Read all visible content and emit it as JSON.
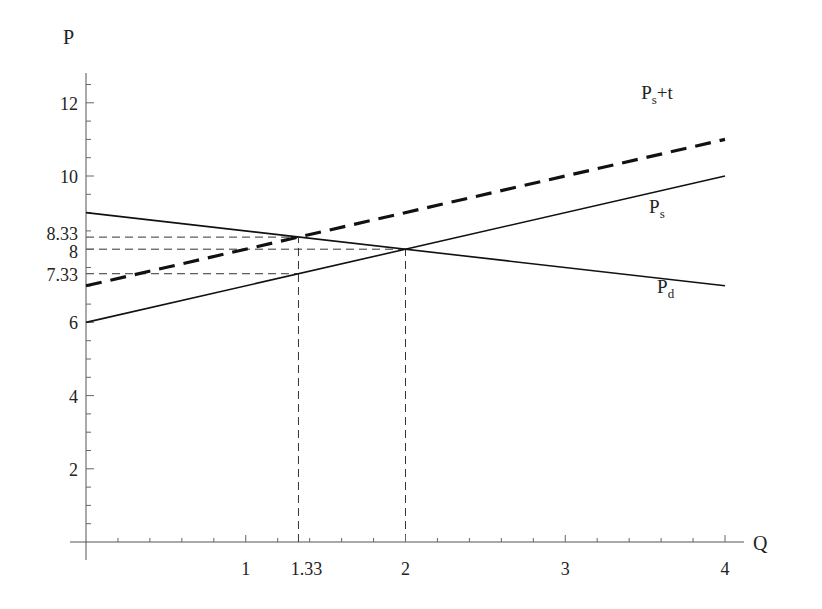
{
  "chart_data": {
    "type": "line",
    "title": "",
    "xlabel": "Q",
    "ylabel": "P",
    "xlim": [
      0,
      4
    ],
    "ylim": [
      0,
      13
    ],
    "grid": false,
    "legend_position": "inline labels at right",
    "x_ticks": [
      {
        "value": 1,
        "label": "1"
      },
      {
        "value": 1.33,
        "label": "1.33"
      },
      {
        "value": 2,
        "label": "2"
      },
      {
        "value": 3,
        "label": "3"
      },
      {
        "value": 4,
        "label": "4"
      }
    ],
    "y_ticks": [
      {
        "value": 2,
        "label": "2"
      },
      {
        "value": 4,
        "label": "4"
      },
      {
        "value": 6,
        "label": "6"
      },
      {
        "value": 7.33,
        "label": "7.33"
      },
      {
        "value": 8,
        "label": "8"
      },
      {
        "value": 8.33,
        "label": "8.33"
      },
      {
        "value": 10,
        "label": "10"
      },
      {
        "value": 12,
        "label": "12"
      }
    ],
    "series": [
      {
        "name": "Ps+t",
        "label_main": "P",
        "label_sub": "s",
        "label_suffix": "+t",
        "style": "dashed-bold",
        "x": [
          0,
          4
        ],
        "y": [
          7,
          11
        ]
      },
      {
        "name": "Ps",
        "label_main": "P",
        "label_sub": "s",
        "label_suffix": "",
        "style": "solid",
        "x": [
          0,
          4
        ],
        "y": [
          6,
          10
        ]
      },
      {
        "name": "Pd",
        "label_main": "P",
        "label_sub": "d",
        "label_suffix": "",
        "style": "solid",
        "x": [
          0,
          4
        ],
        "y": [
          9,
          7
        ]
      }
    ],
    "reference_lines": [
      {
        "type": "horizontal",
        "y": 8.33,
        "x_from": 0,
        "x_to": 1.33
      },
      {
        "type": "horizontal",
        "y": 8,
        "x_from": 0,
        "x_to": 2
      },
      {
        "type": "horizontal",
        "y": 7.33,
        "x_from": 0,
        "x_to": 1.33
      },
      {
        "type": "vertical",
        "x": 1.33,
        "y_from": 0,
        "y_to": 8.33
      },
      {
        "type": "vertical",
        "x": 2,
        "y_from": 0,
        "y_to": 8
      }
    ],
    "annotations": [
      {
        "text": "Ps+t",
        "x": 3.5,
        "y": 12.1
      },
      {
        "text": "Ps",
        "x": 3.55,
        "y": 9.0
      },
      {
        "text": "Pd",
        "x": 3.6,
        "y": 6.8
      }
    ]
  }
}
